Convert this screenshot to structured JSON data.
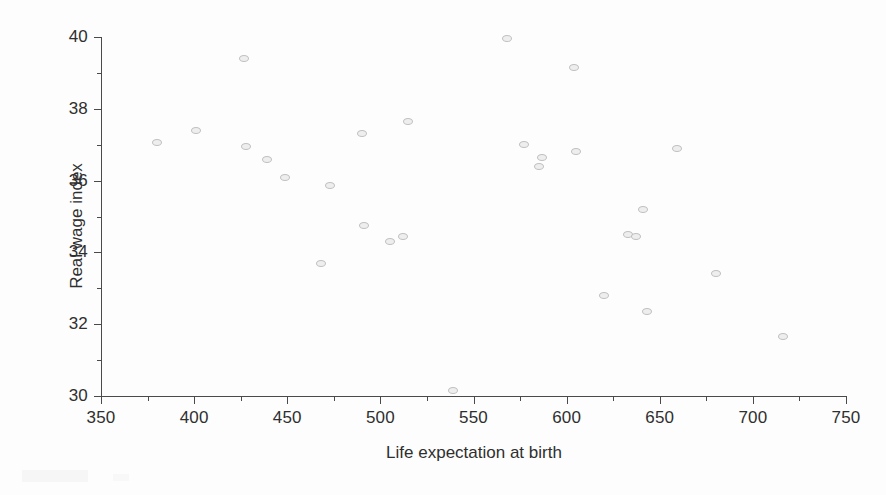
{
  "chart_data": {
    "type": "scatter",
    "title": "",
    "xlabel": "Life expectation at birth",
    "ylabel": "Real wage index",
    "xlim": [
      350,
      750
    ],
    "ylim": [
      30,
      40
    ],
    "grid": false,
    "legend": null,
    "x_ticks": [
      350,
      400,
      450,
      500,
      550,
      600,
      650,
      700,
      750
    ],
    "x_tick_labels": [
      "350",
      "400",
      "450",
      "500",
      "550",
      "600",
      "650",
      "700",
      "750"
    ],
    "x_minor_ticks": [
      375,
      425,
      475,
      525,
      575,
      625,
      675,
      725
    ],
    "y_ticks": [
      30,
      32,
      34,
      36,
      38,
      40
    ],
    "y_tick_labels": [
      "30",
      "32",
      "34",
      "36",
      "38",
      "40"
    ],
    "y_minor_ticks": [
      31,
      33,
      35,
      37,
      39
    ],
    "marker": "open-circle",
    "marker_color": "#eeeeee",
    "marker_edge_color": "#bdbdbd",
    "points": [
      {
        "x": 380,
        "y": 37.05
      },
      {
        "x": 401,
        "y": 37.4
      },
      {
        "x": 427,
        "y": 39.4
      },
      {
        "x": 428,
        "y": 36.95
      },
      {
        "x": 439,
        "y": 36.6
      },
      {
        "x": 449,
        "y": 36.1
      },
      {
        "x": 468,
        "y": 33.7
      },
      {
        "x": 473,
        "y": 35.85
      },
      {
        "x": 490,
        "y": 37.3
      },
      {
        "x": 491,
        "y": 34.75
      },
      {
        "x": 505,
        "y": 34.3
      },
      {
        "x": 512,
        "y": 34.45
      },
      {
        "x": 515,
        "y": 37.65
      },
      {
        "x": 539,
        "y": 30.15
      },
      {
        "x": 568,
        "y": 39.95
      },
      {
        "x": 577,
        "y": 37.0
      },
      {
        "x": 585,
        "y": 36.4
      },
      {
        "x": 587,
        "y": 36.65
      },
      {
        "x": 604,
        "y": 39.15
      },
      {
        "x": 605,
        "y": 36.8
      },
      {
        "x": 620,
        "y": 32.8
      },
      {
        "x": 633,
        "y": 34.5
      },
      {
        "x": 637,
        "y": 34.45
      },
      {
        "x": 641,
        "y": 35.2
      },
      {
        "x": 643,
        "y": 32.35
      },
      {
        "x": 659,
        "y": 36.9
      },
      {
        "x": 680,
        "y": 33.4
      },
      {
        "x": 716,
        "y": 31.65
      }
    ]
  }
}
